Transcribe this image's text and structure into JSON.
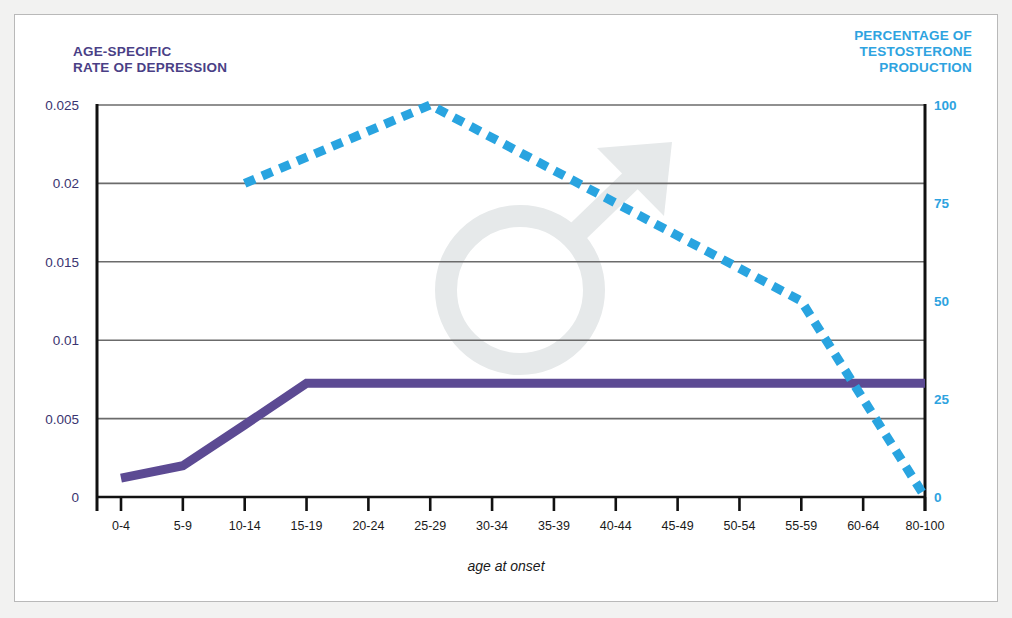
{
  "figure": {
    "background_color": "#f2f2f1",
    "panel_color": "#ffffff",
    "frame_color": "#b9b9b9"
  },
  "titles": {
    "left_axis_title": "AGE-SPECIFIC\nRATE OF DEPRESSION",
    "right_axis_title": "PERCENTAGE OF\nTESTOSTERONE\nPRODUCTION",
    "x_axis_label": "age at onset"
  },
  "colors": {
    "depression_purple": "#5c4a93",
    "testosterone_blue": "#29a4e0",
    "left_label_color": "#3a3470",
    "right_label_color": "#2ea3e0",
    "grid_color": "#6b6b6b",
    "axis_color": "#111111",
    "watermark_color": "#e6e9ea"
  },
  "watermark": {
    "symbol_name": "male-symbol",
    "glyph": "♂"
  },
  "chart_data": {
    "type": "line",
    "title": "",
    "xlabel": "age at onset",
    "grid": true,
    "legend": "none",
    "categories": [
      "0-4",
      "5-9",
      "10-14",
      "15-19",
      "20-24",
      "25-29",
      "30-34",
      "35-39",
      "40-44",
      "45-49",
      "50-54",
      "55-59",
      "60-64",
      "80-100"
    ],
    "axes": {
      "left": {
        "label": "AGE-SPECIFIC RATE OF DEPRESSION",
        "ticks": [
          "0",
          "0.005",
          "0.01",
          "0.015",
          "0.02",
          "0.025"
        ],
        "tick_values": [
          0,
          0.005,
          0.01,
          0.015,
          0.02,
          0.025
        ],
        "ylim": [
          0,
          0.025
        ],
        "color": "#3a3470"
      },
      "right": {
        "label": "PERCENTAGE OF TESTOSTERONE PRODUCTION",
        "ticks": [
          "0",
          "25",
          "50",
          "75",
          "100"
        ],
        "tick_values": [
          0,
          25,
          50,
          75,
          100
        ],
        "ylim": [
          0,
          100
        ],
        "color": "#2ea3e0"
      }
    },
    "series": [
      {
        "name": "Age-specific rate of depression",
        "axis": "left",
        "style": "solid",
        "color": "#5c4a93",
        "linewidth": 9,
        "x": [
          "0-4",
          "5-9",
          "10-14",
          "15-19",
          "20-24",
          "25-29",
          "30-34",
          "35-39",
          "40-44",
          "45-49",
          "50-54",
          "55-59",
          "60-64",
          "80-100"
        ],
        "values": [
          0.0012,
          0.002,
          0.0046,
          0.00725,
          0.00725,
          0.00725,
          0.00725,
          0.00725,
          0.00725,
          0.00725,
          0.00725,
          0.00725,
          0.00725,
          0.00725
        ]
      },
      {
        "name": "Percentage of testosterone production",
        "axis": "right",
        "style": "dashed",
        "color": "#29a4e0",
        "linewidth": 9,
        "x": [
          "10-14",
          "25-29",
          "40-44",
          "55-59",
          "80-100"
        ],
        "values": [
          80,
          100,
          75,
          50,
          0
        ]
      }
    ]
  }
}
